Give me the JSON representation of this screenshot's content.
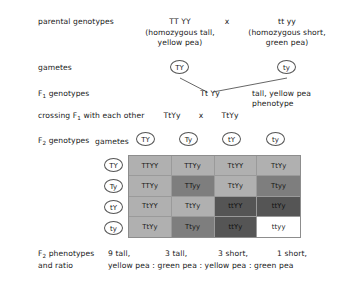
{
  "rows": {
    "parental_label": "parental genotypes",
    "gametes_label": "gametes",
    "f1_label_prefix": "F",
    "f1_label_sub": "1",
    "f1_label_suffix": " genotypes",
    "crossing_prefix": "crossing F",
    "crossing_sub": "1",
    "crossing_suffix": " with each other",
    "f2_label_prefix": "F",
    "f2_label_sub": "2",
    "f2_label_suffix": " genotypes",
    "f2_phen_prefix": "F",
    "f2_phen_sub": "2",
    "f2_phen_suffix": " phenotypes",
    "and_ratio": "and ratio"
  },
  "parental": {
    "left_genotype": "TT YY",
    "left_desc_line1": "(homozygous tall,",
    "left_desc_line2": "yellow pea)",
    "cross_symbol": "x",
    "right_genotype": "tt yy",
    "right_desc_line1": "(homozygous short,",
    "right_desc_line2": "green pea)"
  },
  "parental_gametes": {
    "left": "TY",
    "right": "ty"
  },
  "f1": {
    "genotype": "Tt Yy",
    "phenotype_line1": "tall, yellow pea",
    "phenotype_line2": "phenotype"
  },
  "crossing": {
    "left": "TtYy",
    "symbol": "x",
    "right": "TtYy"
  },
  "f2_square": {
    "gametes_label": "gametes",
    "top_gametes": [
      "TY",
      "Ty",
      "tY",
      "ty"
    ],
    "side_gametes": [
      "TY",
      "Ty",
      "tY",
      "ty"
    ],
    "cells": [
      {
        "genotype": "TTYY",
        "phenotype": "tall-yellow"
      },
      {
        "genotype": "TTYy",
        "phenotype": "tall-yellow"
      },
      {
        "genotype": "TtYY",
        "phenotype": "tall-yellow"
      },
      {
        "genotype": "TtYy",
        "phenotype": "tall-yellow"
      },
      {
        "genotype": "TTYy",
        "phenotype": "tall-yellow"
      },
      {
        "genotype": "TTyy",
        "phenotype": "tall-green"
      },
      {
        "genotype": "TtYy",
        "phenotype": "tall-yellow"
      },
      {
        "genotype": "Ttyy",
        "phenotype": "tall-green"
      },
      {
        "genotype": "TtYY",
        "phenotype": "tall-yellow"
      },
      {
        "genotype": "TtYy",
        "phenotype": "tall-yellow"
      },
      {
        "genotype": "ttYY",
        "phenotype": "short-yellow"
      },
      {
        "genotype": "ttYy",
        "phenotype": "short-yellow"
      },
      {
        "genotype": "TtYy",
        "phenotype": "tall-yellow"
      },
      {
        "genotype": "Ttyy",
        "phenotype": "tall-green"
      },
      {
        "genotype": "ttYy",
        "phenotype": "short-yellow"
      },
      {
        "genotype": "ttyy",
        "phenotype": "short-green"
      }
    ]
  },
  "f2_phenotypes": {
    "counts": [
      "9 tall,",
      "3 tall,",
      "3 short,",
      "1 short,"
    ],
    "ratio_line": "yellow pea : green pea : yellow pea : green pea"
  },
  "colors": {
    "tall_yellow": "#b0b0b0",
    "tall_green": "#7e7e7e",
    "short_yellow": "#555555",
    "short_green": "#ffffff",
    "line": "#555555"
  }
}
